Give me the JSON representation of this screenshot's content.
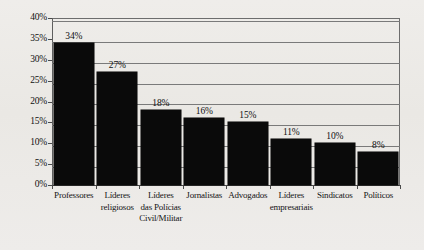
{
  "chart_data": {
    "type": "bar",
    "title": "",
    "subtitle": "",
    "xlabel": "",
    "ylabel": "",
    "ylim": [
      0,
      40
    ],
    "grid": true,
    "legend": "none",
    "orientation": "vertical",
    "bar_color": "#0a0a0a",
    "background_color": "#eceae6",
    "axis_color": "#5f5f5f",
    "gridline_color": "#7a7a7a",
    "categories": [
      "Professores",
      "Líderes religiosos",
      "Líderes das Polícias Civil/Militar",
      "Jornalistas",
      "Advogados",
      "Líderes empresariais",
      "Sindicatos",
      "Políticos"
    ],
    "category_lines": [
      [
        "Professores"
      ],
      [
        "Líderes",
        "religiosos"
      ],
      [
        "Líderes",
        "das Polícias",
        "Civil/Militar"
      ],
      [
        "Jornalistas"
      ],
      [
        "Advogados"
      ],
      [
        "Líderes",
        "empresariais"
      ],
      [
        "Sindicatos"
      ],
      [
        "Políticos"
      ]
    ],
    "values": [
      34,
      27,
      18,
      16,
      15,
      11,
      10,
      8
    ],
    "data_labels": [
      "34%",
      "27%",
      "18%",
      "16%",
      "15%",
      "11%",
      "10%",
      "8%"
    ],
    "ytick_values": [
      0,
      5,
      10,
      15,
      20,
      25,
      30,
      35,
      40
    ],
    "ytick_labels": [
      "0%",
      "5%",
      "10%",
      "15%",
      "20%",
      "25%",
      "30%",
      "35%",
      "40%"
    ]
  }
}
